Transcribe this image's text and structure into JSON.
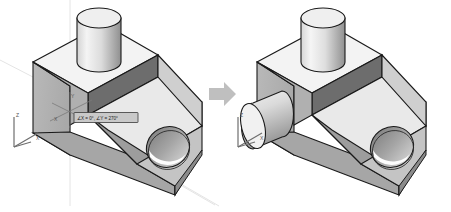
{
  "scene": {
    "title": "Isometric part rotation / feature-add illustration",
    "background_color": "#ffffff",
    "arrow": {
      "name": "transition-arrow",
      "direction": "right",
      "color": "#bfbfbf"
    }
  },
  "annotation": {
    "tooltip_text": "∠X = 0°, ∠Y = 270°",
    "box_fill": "#c9c9c9",
    "box_stroke": "#3a3a3a"
  },
  "axes": {
    "z_label": "Z",
    "x_label": "X",
    "y_label": "Y",
    "origin_y_label": "Y",
    "origin_x_label": "X",
    "triad_color": "#6e6e6e",
    "construction_line_color": "#e2e2e2"
  },
  "colors": {
    "top_face": "#f2f2f2",
    "slope_face": "#e8e8e8",
    "left_face": "#b4b4b4",
    "front_band": "#6f6f6f",
    "front_face": "#a8a8a8",
    "cylinder_top": "#efefef",
    "cylinder_light": "#f0f0f0",
    "cylinder_dark": "#9a9a9a",
    "hole_bore": "#8d8d8d",
    "hole_open": "#fdfdfd",
    "outline": "#1a1a1a"
  },
  "figures": [
    {
      "id": "before",
      "name": "part-before",
      "caption": "",
      "features": [
        "wedge-base",
        "rectangular-boss",
        "vertical-cylinder",
        "through-hole",
        "origin-triad",
        "rotation-tooltip"
      ]
    },
    {
      "id": "after",
      "name": "part-after",
      "caption": "",
      "features": [
        "wedge-base",
        "rectangular-boss",
        "vertical-cylinder",
        "through-hole",
        "horizontal-side-cylinder",
        "origin-triad"
      ]
    }
  ]
}
